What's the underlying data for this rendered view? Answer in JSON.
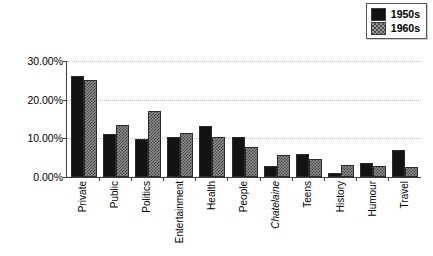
{
  "chart_data": {
    "type": "bar",
    "title": "",
    "subtitle": "",
    "xlabel": "",
    "ylabel": "",
    "ylim": [
      0,
      30
    ],
    "ytick_values": [
      30,
      20,
      10,
      0
    ],
    "ytick_labels": [
      "30.00%",
      "20.00%",
      "10.00%",
      "0.00%"
    ],
    "grid": true,
    "grid_axis": "y",
    "legend_position": "top-right",
    "categories": [
      "Private",
      "Public",
      "Politics",
      "Entertainment",
      "Health",
      "People",
      "Chatelaine",
      "Teens",
      "History",
      "Humour",
      "Travel"
    ],
    "category_styles": [
      "normal",
      "normal",
      "normal",
      "normal",
      "normal",
      "normal",
      "italic",
      "normal",
      "normal",
      "normal",
      "normal"
    ],
    "series": [
      {
        "name": "1950s",
        "color": "#131313",
        "pattern": "solid",
        "values": [
          26.0,
          11.1,
          9.8,
          10.2,
          13.2,
          10.3,
          2.8,
          5.8,
          1.1,
          3.7,
          6.8
        ]
      },
      {
        "name": "1960s",
        "color": "#8f8f8f",
        "pattern": "checkered",
        "values": [
          24.8,
          13.3,
          17.0,
          11.3,
          10.2,
          7.6,
          5.7,
          4.7,
          3.1,
          2.8,
          2.6
        ]
      }
    ]
  },
  "legend": {
    "items": [
      {
        "label": "1950s",
        "swatch": "solid-black-swatch"
      },
      {
        "label": "1960s",
        "swatch": "checkered-gray-swatch"
      }
    ]
  }
}
